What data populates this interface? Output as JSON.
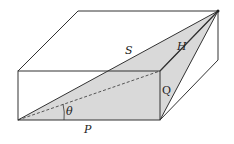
{
  "diagram": {
    "type": "3d-box-geometry",
    "labels": {
      "S": "S",
      "H": "H",
      "Q": "Q",
      "P": "P",
      "theta": "θ"
    },
    "colors": {
      "stroke": "#333333",
      "shade": "#d9d9d9",
      "background": "#ffffff"
    }
  }
}
